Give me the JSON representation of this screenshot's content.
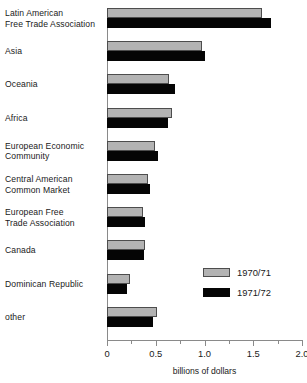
{
  "chart_data": {
    "type": "bar",
    "orientation": "horizontal",
    "title": "",
    "xlabel": "billions of dollars",
    "ylabel": "",
    "xlim": [
      0,
      2.0
    ],
    "xticks": [
      0,
      0.5,
      1.0,
      1.5,
      2.0
    ],
    "xticklabels": [
      "0",
      "0.5",
      "1.0",
      "1.5",
      "2.0"
    ],
    "minor_xticks": [
      0.25,
      0.75,
      1.25,
      1.75
    ],
    "grid": false,
    "legend_position": "center-right",
    "categories": [
      "Latin American Free Trade Association",
      "Asia",
      "Oceania",
      "Africa",
      "European Economic Community",
      "Central American Common Market",
      "European Free Trade Association",
      "Canada",
      "Dominican Republic",
      "other"
    ],
    "category_lines": [
      [
        "Latin American",
        "Free Trade Association"
      ],
      [
        "Asia"
      ],
      [
        "Oceania"
      ],
      [
        "Africa"
      ],
      [
        "European Economic",
        "Community"
      ],
      [
        "Central American",
        "Common Market"
      ],
      [
        "European Free",
        "Trade Association"
      ],
      [
        "Canada"
      ],
      [
        "Dominican Republic"
      ],
      [
        "other"
      ]
    ],
    "series": [
      {
        "name": "1970/71",
        "color": "#b3b3b3",
        "values": [
          1.59,
          0.97,
          0.64,
          0.67,
          0.49,
          0.42,
          0.37,
          0.39,
          0.24,
          0.51
        ]
      },
      {
        "name": "1971/72",
        "color": "#050505",
        "values": [
          1.68,
          1.01,
          0.7,
          0.63,
          0.52,
          0.44,
          0.39,
          0.38,
          0.21,
          0.47
        ]
      }
    ]
  },
  "legend": {
    "items": [
      {
        "label": "1970/71"
      },
      {
        "label": "1971/72"
      }
    ]
  }
}
